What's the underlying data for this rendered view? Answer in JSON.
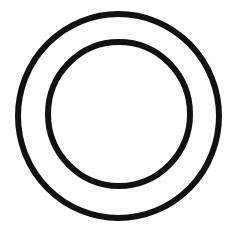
{
  "canvas": {
    "width": 237,
    "height": 233,
    "background": "#ffffff"
  },
  "stroke_color": "#111111",
  "shapes": {
    "outer_circle": {
      "cx": 118.5,
      "cy": 116,
      "rx": 100.5,
      "ry": 102,
      "stroke_width": 6
    },
    "inner_circle": {
      "cx": 119,
      "cy": 114,
      "rx": 71,
      "ry": 72,
      "stroke_width": 6
    }
  }
}
